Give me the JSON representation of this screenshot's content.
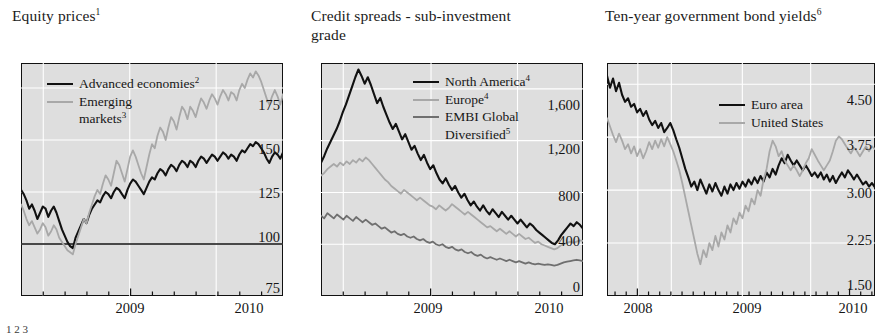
{
  "figure": {
    "style": "bis-quarterly-review-panels",
    "plot_background": "#dedede",
    "grid_color": "#ffffff",
    "frame_color": "#111111"
  },
  "colors": {
    "series_black": "#111111",
    "series_light_gray": "#a8a8a8",
    "series_mid_gray": "#6f6f6f"
  },
  "footnote": "1                                      2                                          3",
  "panels": [
    {
      "id": "equity-prices",
      "title": "Equity prices",
      "title_sup": "1",
      "legend": [
        {
          "label": "Advanced economies",
          "sup": "2",
          "color": "#111111"
        },
        {
          "label": "Emerging",
          "sup": "",
          "color": "#a8a8a8",
          "cont": "markets",
          "cont_sup": "3"
        }
      ],
      "yticks": [
        "175",
        "150",
        "125",
        "100",
        "75"
      ],
      "xticks": [
        "2009",
        "2010"
      ]
    },
    {
      "id": "credit-spreads",
      "title": "Credit spreads - sub-investment grade",
      "title_line1": "Credit spreads - sub-investment",
      "title_line2": "grade",
      "title_sup": "",
      "legend": [
        {
          "label": "North America",
          "sup": "4",
          "color": "#111111"
        },
        {
          "label": "Europe",
          "sup": "4",
          "color": "#a8a8a8"
        },
        {
          "label": "EMBI Global",
          "sup": "",
          "color": "#6f6f6f",
          "cont": "Diversified",
          "cont_sup": "5"
        }
      ],
      "yticks": [
        "1,600",
        "1,200",
        "800",
        "400",
        "0"
      ],
      "xticks": [
        "2009",
        "2010"
      ]
    },
    {
      "id": "bond-yields",
      "title": "Ten-year government bond yields",
      "title_sup": "6",
      "legend": [
        {
          "label": "Euro area",
          "sup": "",
          "color": "#111111"
        },
        {
          "label": "United States",
          "sup": "",
          "color": "#a8a8a8"
        }
      ],
      "yticks": [
        "4.50",
        "3.75",
        "3.00",
        "2.25",
        "1.50"
      ],
      "xticks": [
        "2008",
        "2009",
        "2010"
      ]
    }
  ],
  "chart_data": [
    {
      "type": "line",
      "title": "Equity prices",
      "xlabel": "",
      "ylabel": "",
      "ylim": [
        75,
        187
      ],
      "yticks": [
        75,
        100,
        125,
        150,
        175
      ],
      "xticklabels": [
        "2009",
        "2010"
      ],
      "grid": true,
      "legend_position": "top-left",
      "baseline": 100,
      "series": [
        {
          "name": "Advanced economies",
          "color": "#111111",
          "values": [
            126,
            124,
            121,
            117,
            119,
            116,
            112,
            115,
            118,
            117,
            113,
            116,
            118,
            115,
            111,
            107,
            104,
            101,
            99,
            98,
            103,
            106,
            109,
            112,
            110,
            114,
            117,
            119,
            121,
            120,
            123,
            125,
            124,
            122,
            125,
            127,
            126,
            124,
            122,
            126,
            129,
            131,
            130,
            128,
            126,
            124,
            127,
            130,
            132,
            131,
            134,
            136,
            135,
            133,
            136,
            138,
            137,
            135,
            138,
            140,
            139,
            137,
            140,
            139,
            137,
            140,
            142,
            141,
            139,
            141,
            143,
            142,
            140,
            142,
            144,
            143,
            141,
            143,
            142,
            140,
            143,
            145,
            144,
            146,
            148,
            147,
            149,
            148,
            146,
            144,
            141,
            139,
            142,
            144,
            143,
            141,
            144
          ]
        },
        {
          "name": "Emerging markets",
          "color": "#a8a8a8",
          "values": [
            119,
            116,
            112,
            109,
            111,
            108,
            105,
            107,
            110,
            108,
            104,
            106,
            109,
            107,
            103,
            101,
            99,
            97,
            96,
            95,
            100,
            104,
            108,
            112,
            110,
            115,
            119,
            123,
            126,
            124,
            129,
            133,
            131,
            128,
            134,
            140,
            138,
            134,
            130,
            136,
            142,
            145,
            142,
            138,
            134,
            131,
            137,
            143,
            148,
            146,
            152,
            156,
            154,
            150,
            156,
            161,
            159,
            155,
            161,
            166,
            164,
            160,
            166,
            164,
            161,
            166,
            170,
            168,
            165,
            169,
            172,
            170,
            167,
            171,
            174,
            172,
            169,
            173,
            172,
            169,
            174,
            177,
            175,
            179,
            182,
            180,
            183,
            181,
            178,
            174,
            170,
            167,
            171,
            174,
            171,
            167,
            172
          ]
        }
      ]
    },
    {
      "type": "line",
      "title": "Credit spreads - sub-investment grade",
      "xlabel": "",
      "ylabel": "",
      "ylim": [
        0,
        1800
      ],
      "yticks": [
        0,
        400,
        800,
        1200,
        1600
      ],
      "xticklabels": [
        "2009",
        "2010"
      ],
      "grid": true,
      "legend_position": "top-center",
      "series": [
        {
          "name": "North America",
          "color": "#111111",
          "values": [
            1030,
            1080,
            1140,
            1190,
            1240,
            1290,
            1350,
            1420,
            1480,
            1550,
            1620,
            1690,
            1750,
            1700,
            1640,
            1690,
            1630,
            1560,
            1490,
            1530,
            1460,
            1400,
            1340,
            1290,
            1330,
            1270,
            1210,
            1250,
            1190,
            1130,
            1160,
            1100,
            1050,
            1090,
            1030,
            980,
            1010,
            950,
            900,
            870,
            910,
            860,
            820,
            850,
            800,
            760,
            790,
            740,
            700,
            730,
            690,
            660,
            700,
            660,
            630,
            670,
            640,
            610,
            650,
            620,
            590,
            620,
            590,
            560,
            590,
            560,
            530,
            560,
            540,
            510,
            490,
            470,
            450,
            430,
            410,
            400,
            430,
            470,
            500,
            530,
            560,
            540,
            570,
            550,
            520
          ]
        },
        {
          "name": "Europe",
          "color": "#a8a8a8",
          "values": [
            930,
            950,
            980,
            1000,
            1020,
            1000,
            1030,
            1010,
            1040,
            1020,
            1050,
            1030,
            1060,
            1040,
            1070,
            1050,
            1020,
            990,
            960,
            930,
            900,
            880,
            850,
            830,
            810,
            790,
            820,
            800,
            780,
            760,
            740,
            760,
            740,
            720,
            700,
            690,
            670,
            700,
            680,
            660,
            680,
            710,
            690,
            670,
            650,
            630,
            650,
            630,
            610,
            590,
            570,
            550,
            530,
            540,
            520,
            500,
            520,
            500,
            480,
            500,
            480,
            460,
            480,
            460,
            440,
            450,
            430,
            410,
            420,
            400,
            390,
            380,
            370,
            360,
            370,
            390,
            400,
            410,
            420,
            410,
            420,
            430,
            425
          ]
        },
        {
          "name": "EMBI Global Diversified",
          "color": "#6f6f6f",
          "values": [
            620,
            600,
            640,
            620,
            600,
            630,
            610,
            590,
            620,
            600,
            580,
            610,
            590,
            570,
            590,
            570,
            550,
            560,
            540,
            520,
            530,
            510,
            490,
            500,
            480,
            470,
            480,
            460,
            450,
            460,
            440,
            430,
            440,
            420,
            410,
            420,
            400,
            390,
            400,
            380,
            370,
            380,
            360,
            350,
            360,
            340,
            330,
            340,
            320,
            310,
            320,
            300,
            290,
            300,
            290,
            280,
            290,
            280,
            270,
            280,
            270,
            260,
            270,
            260,
            250,
            260,
            250,
            245,
            250,
            245,
            240,
            245,
            240,
            235,
            240,
            250,
            260,
            265,
            270,
            275,
            280,
            275,
            270
          ]
        }
      ]
    },
    {
      "type": "line",
      "title": "Ten-year government bond yields",
      "xlabel": "",
      "ylabel": "",
      "ylim": [
        1.5,
        4.8
      ],
      "yticks": [
        1.5,
        2.25,
        3.0,
        3.75,
        4.5
      ],
      "xticklabels": [
        "2008",
        "2009",
        "2010"
      ],
      "grid": true,
      "legend_position": "top-center",
      "series": [
        {
          "name": "Euro area",
          "color": "#111111",
          "values": [
            4.62,
            4.45,
            4.58,
            4.4,
            4.52,
            4.35,
            4.25,
            4.3,
            4.18,
            4.22,
            4.1,
            4.15,
            4.05,
            4.12,
            4.0,
            3.92,
            3.98,
            3.88,
            3.95,
            3.82,
            3.88,
            3.95,
            3.85,
            3.72,
            3.6,
            3.45,
            3.3,
            3.18,
            3.05,
            3.12,
            3.0,
            3.15,
            3.05,
            2.95,
            3.08,
            2.98,
            3.1,
            3.0,
            2.92,
            3.05,
            2.95,
            3.08,
            3.0,
            3.1,
            3.02,
            3.12,
            3.05,
            3.15,
            3.08,
            3.18,
            3.1,
            3.2,
            3.12,
            3.25,
            3.18,
            3.3,
            3.22,
            3.35,
            3.45,
            3.38,
            3.5,
            3.42,
            3.35,
            3.42,
            3.35,
            3.28,
            3.35,
            3.28,
            3.2,
            3.25,
            3.18,
            3.25,
            3.15,
            3.22,
            3.12,
            3.2,
            3.1,
            3.18,
            3.25,
            3.18,
            3.28,
            3.22,
            3.15,
            3.22,
            3.15,
            3.08,
            3.12,
            3.05,
            3.1,
            3.04
          ]
        },
        {
          "name": "United States",
          "color": "#a8a8a8",
          "values": [
            4.02,
            3.9,
            3.78,
            3.68,
            3.8,
            3.7,
            3.58,
            3.65,
            3.52,
            3.62,
            3.48,
            3.58,
            3.45,
            3.55,
            3.68,
            3.58,
            3.7,
            3.6,
            3.72,
            3.62,
            3.75,
            3.65,
            3.55,
            3.42,
            3.28,
            3.1,
            2.9,
            2.7,
            2.5,
            2.3,
            2.1,
            1.95,
            2.15,
            2.05,
            2.25,
            2.15,
            2.35,
            2.2,
            2.4,
            2.3,
            2.5,
            2.4,
            2.6,
            2.52,
            2.68,
            2.6,
            2.78,
            2.7,
            2.88,
            2.8,
            3.0,
            2.92,
            3.15,
            3.3,
            3.55,
            3.7,
            3.62,
            3.48,
            3.55,
            3.42,
            3.35,
            3.28,
            3.35,
            3.28,
            3.2,
            3.28,
            3.38,
            3.45,
            3.58,
            3.5,
            3.42,
            3.35,
            3.28,
            3.35,
            3.42,
            3.55,
            3.7,
            3.76,
            3.72,
            3.65,
            3.58,
            3.52,
            3.6,
            3.55,
            3.48,
            3.55,
            3.62,
            3.55,
            3.62,
            3.58
          ]
        }
      ]
    }
  ]
}
